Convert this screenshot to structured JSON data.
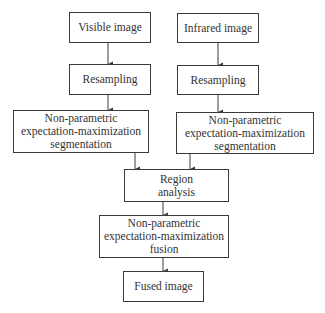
{
  "diagram": {
    "type": "flowchart",
    "nodes": {
      "visible": {
        "lines": [
          "Visible image"
        ]
      },
      "infrared": {
        "lines": [
          "Infrared image"
        ]
      },
      "resample_left": {
        "lines": [
          "Resampling"
        ]
      },
      "resample_right": {
        "lines": [
          "Resampling"
        ]
      },
      "seg_left": {
        "lines": [
          "Non-parametric",
          "expectation-maximization",
          "segmentation"
        ]
      },
      "seg_right": {
        "lines": [
          "Non-parametric",
          "expectation-maximization",
          "segmentation"
        ]
      },
      "region": {
        "lines": [
          "Region",
          "analysis"
        ]
      },
      "fusion": {
        "lines": [
          "Non-parametric",
          "expectation-maximization",
          "fusion"
        ]
      },
      "fused": {
        "lines": [
          "Fused image"
        ]
      }
    },
    "edges": [
      {
        "from": "visible",
        "to": "resample_left"
      },
      {
        "from": "infrared",
        "to": "resample_right"
      },
      {
        "from": "resample_left",
        "to": "seg_left"
      },
      {
        "from": "resample_right",
        "to": "seg_right"
      },
      {
        "from": "seg_left",
        "to": "region"
      },
      {
        "from": "seg_right",
        "to": "region"
      },
      {
        "from": "region",
        "to": "fusion"
      },
      {
        "from": "fusion",
        "to": "fused"
      }
    ],
    "colors": {
      "stroke": "#3a3a3a",
      "text": "#333333",
      "background": "#ffffff"
    }
  }
}
